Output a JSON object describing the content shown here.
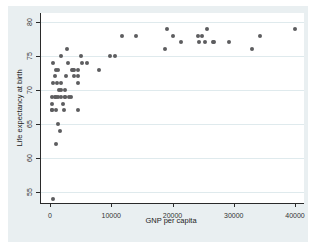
{
  "chart_data": {
    "type": "scatter",
    "title": "",
    "xlabel": "GNP per capita",
    "ylabel": "Life expectancy at birth",
    "x_ticks": [
      0,
      10000,
      20000,
      30000,
      40000
    ],
    "y_ticks": [
      55,
      60,
      65,
      70,
      75,
      80
    ],
    "xlim": [
      -1500,
      41500
    ],
    "ylim": [
      53.4,
      81.3
    ],
    "grid": "horizontal-only",
    "legend": "none",
    "marker_color": "#5d5d5f",
    "grid_color": "#dfeaed",
    "background_color": "#e9eff1",
    "plot_background": "#ffffff",
    "axis_color": "#2a2a2a",
    "points": [
      [
        410,
        54
      ],
      [
        1010,
        62
      ],
      [
        1640,
        64
      ],
      [
        1340,
        65
      ],
      [
        380,
        67
      ],
      [
        380,
        67
      ],
      [
        980,
        67
      ],
      [
        2260,
        67
      ],
      [
        4630,
        67
      ],
      [
        370,
        68
      ],
      [
        2180,
        68
      ],
      [
        370,
        69
      ],
      [
        740,
        69
      ],
      [
        950,
        69
      ],
      [
        1360,
        69
      ],
      [
        1850,
        69
      ],
      [
        2420,
        69
      ],
      [
        2440,
        69
      ],
      [
        3160,
        69
      ],
      [
        3360,
        69
      ],
      [
        1520,
        70
      ],
      [
        1760,
        70
      ],
      [
        2470,
        70
      ],
      [
        480,
        71
      ],
      [
        1220,
        71
      ],
      [
        1770,
        71
      ],
      [
        4510,
        71
      ],
      [
        810,
        72
      ],
      [
        2540,
        72
      ],
      [
        3840,
        72
      ],
      [
        4520,
        72
      ],
      [
        970,
        73
      ],
      [
        1290,
        73
      ],
      [
        3530,
        73
      ],
      [
        3700,
        73
      ],
      [
        3910,
        73
      ],
      [
        4620,
        73
      ],
      [
        8030,
        73
      ],
      [
        460,
        74
      ],
      [
        2990,
        74
      ],
      [
        5150,
        74
      ],
      [
        6070,
        74
      ],
      [
        1740,
        75
      ],
      [
        4990,
        75
      ],
      [
        9780,
        75
      ],
      [
        10670,
        75
      ],
      [
        2770,
        76
      ],
      [
        18710,
        76
      ],
      [
        33040,
        76
      ],
      [
        21410,
        77
      ],
      [
        24280,
        77
      ],
      [
        25380,
        77
      ],
      [
        26570,
        77
      ],
      [
        26830,
        77
      ],
      [
        29240,
        77
      ],
      [
        11740,
        78
      ],
      [
        14100,
        78
      ],
      [
        20090,
        78
      ],
      [
        24210,
        78
      ],
      [
        24780,
        78
      ],
      [
        34310,
        78
      ],
      [
        19170,
        79
      ],
      [
        25580,
        79
      ],
      [
        39980,
        79
      ]
    ]
  }
}
